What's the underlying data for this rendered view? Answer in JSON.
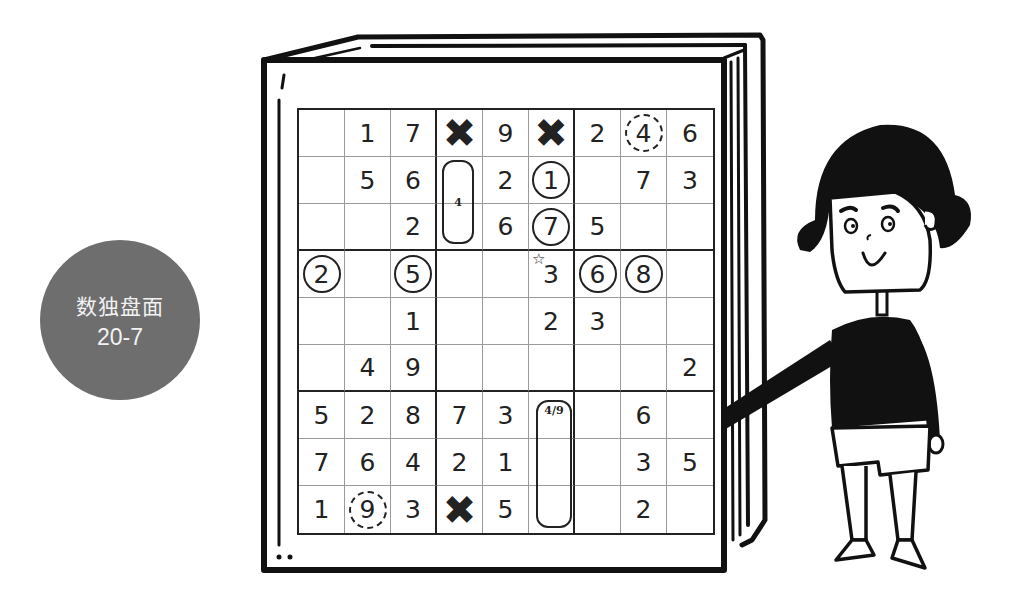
{
  "badge": {
    "title": "数独盘面",
    "subtitle": "20-7",
    "color": "#6e6e6e"
  },
  "puzzle": {
    "rows": [
      [
        "",
        "1",
        "7",
        "X",
        "9",
        "X",
        "2",
        "4",
        "6"
      ],
      [
        "",
        "5",
        "6",
        "",
        "2",
        "1",
        "",
        "7",
        "3"
      ],
      [
        "",
        "",
        "2",
        "",
        "6",
        "7",
        "5",
        "",
        ""
      ],
      [
        "2",
        "",
        "5",
        "",
        "",
        "3",
        "6",
        "8",
        ""
      ],
      [
        "",
        "",
        "1",
        "",
        "",
        "2",
        "3",
        "",
        ""
      ],
      [
        "",
        "4",
        "9",
        "",
        "",
        "",
        "",
        "",
        "2"
      ],
      [
        "5",
        "2",
        "8",
        "7",
        "3",
        "",
        "",
        "6",
        ""
      ],
      [
        "7",
        "6",
        "4",
        "2",
        "1",
        "",
        "",
        "3",
        "5"
      ],
      [
        "1",
        "9",
        "3",
        "X",
        "5",
        "",
        "",
        "2",
        ""
      ]
    ],
    "circled_solid": [
      "r2c6",
      "r3c6",
      "r4c1",
      "r4c3",
      "r4c7",
      "r4c8"
    ],
    "circled_dashed": [
      "r1c8",
      "r9c2"
    ],
    "x_marks": [
      "r1c4",
      "r1c6",
      "r9c4"
    ],
    "candidate_groups": [
      {
        "cells": "r2c4-r3c4",
        "note": "4"
      },
      {
        "cells": "r7c6-r9c6",
        "note": "4/9"
      }
    ],
    "star_marker": "r4c6",
    "star_glyph": "☆"
  },
  "illustration": {
    "book": "open book frame around grid",
    "character": "girl with black bob hair pointing at grid"
  }
}
